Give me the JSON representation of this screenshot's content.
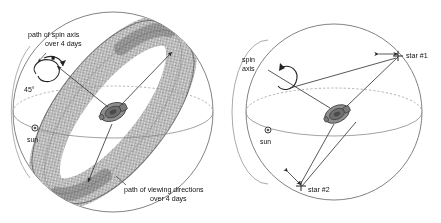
{
  "figure": {
    "domain": "diagram",
    "type": "two-panel scientific schematic",
    "background_color": "#ffffff",
    "line_color": "#6b6b6b",
    "text_color": "#111111",
    "band_color": "#b9b9b9",
    "panel_count": 2
  },
  "left_panel": {
    "name": "spin-axis-precession-panel",
    "labels": {
      "spin_axis_path_line1": "path of spin axis",
      "spin_axis_path_line2": "over 4 days",
      "angle": "45°",
      "sun": "sun",
      "viewing_line1": "path of viewing directions",
      "viewing_line2": "over 4 days"
    },
    "elements": {
      "sphere": "celestial-sphere",
      "equator": "ecliptic-equator-circle",
      "band": "scanned-great-circle-band",
      "spacecraft": "spacecraft-icon",
      "sun_marker": "sun-symbol",
      "precession_loop": "spin-axis-precession-loop"
    }
  },
  "right_panel": {
    "name": "star-observation-panel",
    "labels": {
      "spin_axis_line1": "spin",
      "spin_axis_line2": "axis",
      "sun": "sun",
      "star1": "star #1",
      "star2": "star #2"
    },
    "elements": {
      "sphere": "celestial-sphere",
      "equator": "ecliptic-equator-circle",
      "great_circle_solid": "scan-great-circle",
      "great_circle_dashed": "hidden-great-circle",
      "spacecraft": "spacecraft-icon",
      "sun_marker": "sun-symbol",
      "spin_arrow": "spin-rotation-arrow",
      "star1_marker": "star-1-marker",
      "star2_marker": "star-2-marker"
    }
  }
}
